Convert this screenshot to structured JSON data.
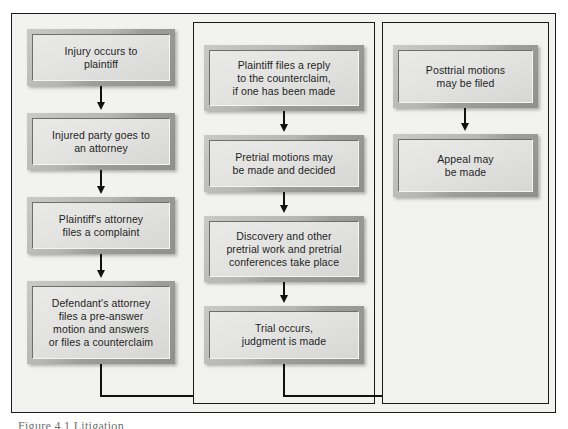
{
  "diagram": {
    "caption_partial": "Figure 4.1  Litigation",
    "colors": {
      "frame_border": "#1b1b1b",
      "panel_background": "#f2f2f0",
      "box_bevel": "#a8a8a6",
      "box_fill": "#e6e6e4",
      "connector": "#111111",
      "text": "#1f1f1f"
    },
    "columns": [
      {
        "id": "column-one",
        "name": "pretrial-initiation-column",
        "has_border": false,
        "nodes": [
          {
            "id": "node-1",
            "name": "injury-occurs-node",
            "label": "Injury occurs to\nplaintiff"
          },
          {
            "id": "node-2",
            "name": "party-to-attorney-node",
            "label": "Injured party goes to\nan attorney"
          },
          {
            "id": "node-3",
            "name": "complaint-filed-node",
            "label": "Plaintiff's attorney\nfiles a complaint"
          },
          {
            "id": "node-4",
            "name": "defendant-response-node",
            "label": "Defendant's attorney\nfiles a pre-answer\nmotion and answers\nor files a counterclaim"
          }
        ]
      },
      {
        "id": "column-two",
        "name": "pretrial-and-trial-column",
        "has_border": true,
        "nodes": [
          {
            "id": "node-5",
            "name": "reply-to-counterclaim-node",
            "label": "Plaintiff files a reply\nto the counterclaim,\nif one has been made"
          },
          {
            "id": "node-6",
            "name": "pretrial-motions-node",
            "label": "Pretrial motions may\nbe made and decided"
          },
          {
            "id": "node-7",
            "name": "discovery-node",
            "label": "Discovery and other\npretrial work and pretrial\nconferences take place"
          },
          {
            "id": "node-8",
            "name": "trial-node",
            "label": "Trial occurs,\njudgment is made"
          }
        ]
      },
      {
        "id": "column-three",
        "name": "posttrial-column",
        "has_border": true,
        "nodes": [
          {
            "id": "node-9",
            "name": "posttrial-motions-node",
            "label": "Posttrial motions\nmay be filed"
          },
          {
            "id": "node-10",
            "name": "appeal-node",
            "label": "Appeal may\nbe made"
          }
        ]
      }
    ],
    "connectors": [
      {
        "id": "c1",
        "name": "arrow-injury-to-attorney",
        "from": "node-1",
        "to": "node-2",
        "type": "vertical-arrow"
      },
      {
        "id": "c2",
        "name": "arrow-attorney-to-complaint",
        "from": "node-2",
        "to": "node-3",
        "type": "vertical-arrow"
      },
      {
        "id": "c3",
        "name": "arrow-complaint-to-defendant",
        "from": "node-3",
        "to": "node-4",
        "type": "vertical-arrow"
      },
      {
        "id": "c4",
        "name": "elbow-column-one-to-column-two",
        "from": "node-4",
        "to": "node-5",
        "type": "elbow"
      },
      {
        "id": "c5",
        "name": "arrow-reply-to-pretrial-motions",
        "from": "node-5",
        "to": "node-6",
        "type": "vertical-arrow"
      },
      {
        "id": "c6",
        "name": "arrow-motions-to-discovery",
        "from": "node-6",
        "to": "node-7",
        "type": "vertical-arrow"
      },
      {
        "id": "c7",
        "name": "arrow-discovery-to-trial",
        "from": "node-7",
        "to": "node-8",
        "type": "vertical-arrow"
      },
      {
        "id": "c8",
        "name": "elbow-column-two-to-column-three",
        "from": "node-8",
        "to": "node-9",
        "type": "elbow"
      },
      {
        "id": "c9",
        "name": "arrow-posttrial-to-appeal",
        "from": "node-9",
        "to": "node-10",
        "type": "vertical-arrow"
      }
    ]
  }
}
